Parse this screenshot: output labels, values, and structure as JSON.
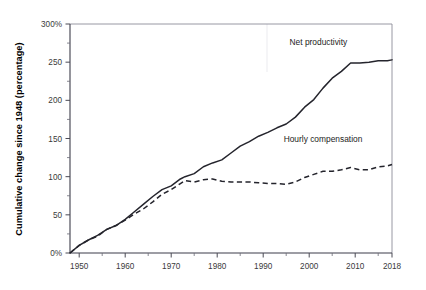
{
  "chart_data": {
    "type": "line",
    "title": "",
    "subtitle": "",
    "xlabel": "",
    "ylabel": "Cumulative change since 1948 (percentage)",
    "xlim": [
      1948,
      2018
    ],
    "ylim": [
      0,
      300
    ],
    "grid": false,
    "legend_position": "inline-annotation",
    "y_tick_labels": [
      "0%",
      "50",
      "100",
      "150",
      "200",
      "250",
      "300%"
    ],
    "y_tick_values": [
      0,
      50,
      100,
      150,
      200,
      250,
      300
    ],
    "y_minor_tick_values": [
      25,
      75,
      125,
      175,
      225,
      275
    ],
    "x_tick_labels": [
      "1950",
      "1960",
      "1970",
      "1980",
      "1990",
      "2000",
      "2010",
      "2018"
    ],
    "x_tick_values": [
      1950,
      1960,
      1970,
      1980,
      1990,
      2000,
      2010,
      2018
    ],
    "x_minor_tick_values": [
      1955,
      1965,
      1975,
      1985,
      1995,
      2005,
      2015
    ],
    "annotations": [
      {
        "text": "Net productivity",
        "x": 2002,
        "y": 272
      },
      {
        "text": "Hourly compensation",
        "x": 2003,
        "y": 146
      }
    ],
    "series": [
      {
        "name": "Net productivity",
        "style": "solid",
        "color": "#24242c",
        "x": [
          1948,
          1950,
          1952,
          1954,
          1956,
          1958,
          1960,
          1962,
          1964,
          1966,
          1968,
          1970,
          1972,
          1973,
          1975,
          1977,
          1979,
          1981,
          1983,
          1985,
          1987,
          1989,
          1991,
          1993,
          1995,
          1997,
          1999,
          2001,
          2003,
          2005,
          2007,
          2009,
          2011,
          2013,
          2015,
          2017,
          2018
        ],
        "values": [
          0,
          10,
          17,
          23,
          31,
          36,
          44,
          54,
          64,
          74,
          83,
          88,
          97,
          100,
          104,
          113,
          118,
          122,
          131,
          140,
          146,
          153,
          158,
          164,
          169,
          178,
          191,
          201,
          216,
          229,
          238,
          249,
          249,
          250,
          252,
          252,
          253
        ]
      },
      {
        "name": "Hourly compensation",
        "style": "dashed",
        "color": "#24242c",
        "x": [
          1948,
          1950,
          1952,
          1954,
          1956,
          1958,
          1960,
          1962,
          1964,
          1966,
          1968,
          1970,
          1972,
          1973,
          1975,
          1977,
          1979,
          1981,
          1983,
          1985,
          1987,
          1989,
          1991,
          1993,
          1995,
          1997,
          1999,
          2001,
          2003,
          2005,
          2007,
          2009,
          2011,
          2013,
          2015,
          2017,
          2018
        ],
        "values": [
          0,
          10,
          17,
          22,
          31,
          36,
          43,
          51,
          58,
          67,
          77,
          83,
          91,
          95,
          93,
          96,
          97,
          94,
          93,
          93,
          93,
          92,
          91,
          91,
          90,
          93,
          99,
          103,
          107,
          107,
          109,
          112,
          109,
          109,
          113,
          114,
          116
        ]
      }
    ]
  },
  "axes": {
    "y_axis_title": "Cumulative change since 1948 (percentage)"
  }
}
